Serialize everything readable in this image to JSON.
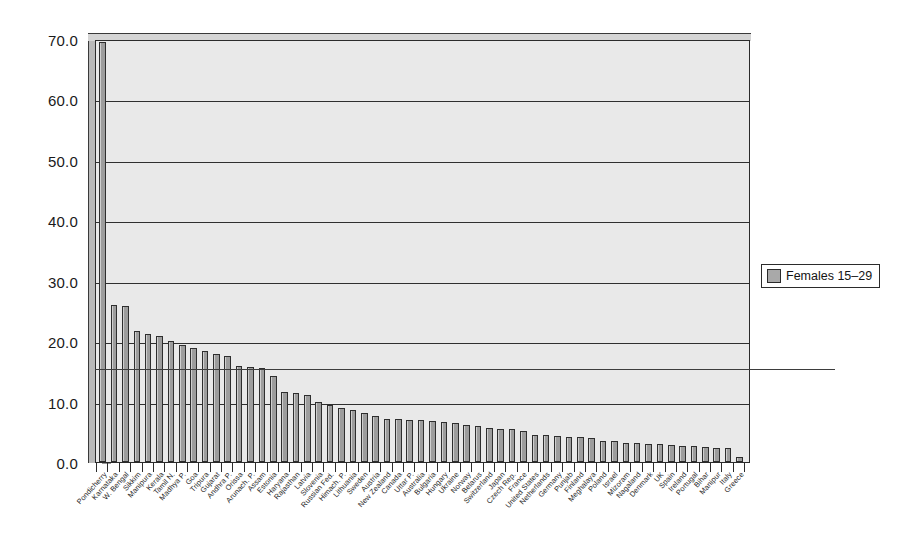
{
  "chart_data": {
    "type": "bar",
    "title": "",
    "subtitle": "",
    "xlabel": "",
    "ylabel": "",
    "ylim": [
      0.0,
      70.0
    ],
    "yticks": [
      0.0,
      10.0,
      20.0,
      30.0,
      40.0,
      50.0,
      60.0,
      70.0
    ],
    "ytick_labels": [
      "0.0",
      "10.0",
      "20.0",
      "30.0",
      "40.0",
      "50.0",
      "60.0",
      "70.0"
    ],
    "grid": "horizontal",
    "legend_position": "right",
    "series": [
      {
        "name": "Females 15–29",
        "color": "#a9a9a9",
        "values": [
          69.5,
          26.0,
          25.9,
          21.6,
          21.2,
          20.9,
          20.0,
          19.3,
          18.8,
          18.4,
          17.9,
          17.5,
          15.9,
          15.7,
          15.6,
          14.3,
          11.6,
          11.4,
          11.1,
          9.9,
          9.5,
          9.0,
          8.6,
          8.1,
          7.6,
          7.2,
          7.1,
          7.0,
          6.9,
          6.8,
          6.6,
          6.4,
          6.2,
          6.0,
          5.7,
          5.5,
          5.4,
          5.2,
          4.5,
          4.4,
          4.3,
          4.2,
          4.1,
          3.9,
          3.5,
          3.4,
          3.2,
          3.1,
          3.0,
          2.9,
          2.8,
          2.7,
          2.6,
          2.5,
          2.4,
          2.3,
          0.8
        ]
      }
    ],
    "categories": [
      "Pondicherry",
      "Karnataka",
      "W. Bengal",
      "Sikkim",
      "Manipura",
      "Kerala",
      "Tamil N.",
      "Madhya P.",
      "Goa",
      "Tripura",
      "Gujarat",
      "Andhra P.",
      "Orissa",
      "Arunach. P.",
      "Assam",
      "Estonia",
      "Haryana",
      "Rajasthan",
      "Latvia",
      "Slovenia",
      "Russian Fed.",
      "Himach. P.",
      "Lithuania",
      "Sweden",
      "Austria",
      "New Zealand",
      "Canada",
      "Uttar P.",
      "Australia",
      "Bulgaria",
      "Hungary",
      "Ukraine",
      "Norway",
      "Belarus",
      "Switzerland",
      "Japan",
      "Czech Rep.",
      "France",
      "United States",
      "Netherlands",
      "Germany",
      "Punjab",
      "Finland",
      "Meghalaya",
      "Poland",
      "Israel",
      "Mizoram",
      "Nagaland",
      "Denmark",
      "UK",
      "Spain",
      "Ireland",
      "Portugal",
      "Bihar",
      "Manipur",
      "Italy",
      "Greece"
    ],
    "reference_line": {
      "value": 15.5,
      "label": ""
    }
  },
  "legend": {
    "entries": [
      {
        "label": "Females 15–29",
        "color": "#a9a9a9",
        "swatch": "square-swatch"
      }
    ]
  }
}
